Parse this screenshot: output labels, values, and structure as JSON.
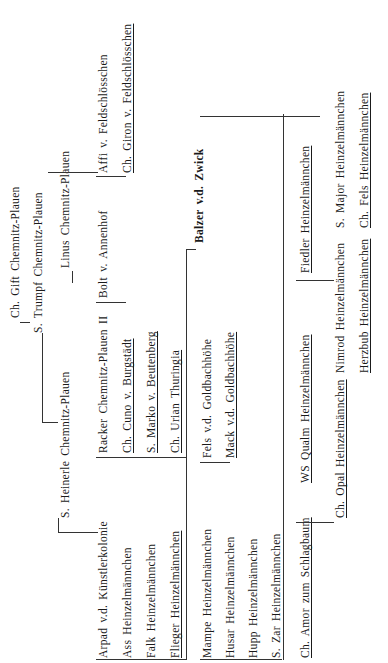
{
  "pedigree": {
    "gen1": {
      "label": "Balzer v.d. Zwick"
    },
    "sire_line": {
      "s": "S. Trumpf Chemnitz-Plauen",
      "ss": "Ch. Gift Chemnitz-Plauen",
      "sd_s": "S. Heinerle Chemnitz-Plauen",
      "linus": "Linus Chemnitz-Plauen",
      "arpad": "Arpad v.d. Künstlerkolonie",
      "racker": "Racker Chemnitz-Plauen II",
      "bolt": "Bolt v. Annenhof",
      "affi": "Affi v. Feldschlösschen",
      "ass": "Ass Heinzelmännchen",
      "cuno": "Ch. Cuno v. Burgstädt",
      "giron": "Ch. Giron v. Feldschlösschen",
      "falk": "Falk Heinzelmännchen",
      "marko": "S. Marko v. Beutenberg",
      "flieger": "Flieger Heinzelmännchen",
      "urian": "Ch. Urian Thuringia"
    },
    "dam_line": {
      "mampe": "Mampe Heinzelmännchen",
      "fels_gb": "Fels v.d. Goldbachhöhe",
      "husar": "Husar Heinzelmännchen",
      "mack": "Mack v.d. Goldbachhöhe",
      "hupp": "Hupp Heinzelmännchen",
      "zar": "S. Zar Heinzelmännchen",
      "amor": "Ch. Amor zum Schlagbaum",
      "qualm": "WS Qualm Heinzelmännchen",
      "fiedler": "Fiedler Heinzelmännchen",
      "opal": "Ch. Opal Heinzelmännchen",
      "nimrod": "Nimrod Heinzelmännchen",
      "major": "S. Major Heinzelmännchen",
      "herzbub": "Herzbub Heinzelmännchen",
      "chfels": "Ch. Fels Heinzelmännchen"
    }
  }
}
